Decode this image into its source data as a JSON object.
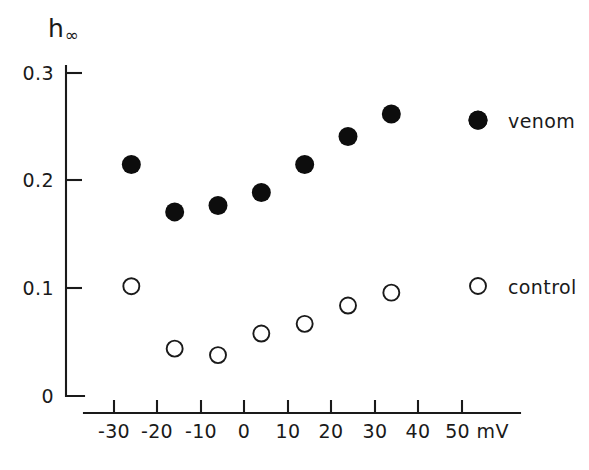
{
  "chart_data": {
    "type": "scatter",
    "title": "",
    "xlabel": "mV",
    "ylabel": "h∞",
    "ylabel_base": "h",
    "ylabel_sub": "∞",
    "xlim": [
      -35,
      57
    ],
    "ylim": [
      0,
      0.315
    ],
    "grid": false,
    "legend_position": "right",
    "xticks": [
      -30,
      -20,
      -10,
      0,
      10,
      20,
      30,
      40,
      50
    ],
    "xtick_labels": [
      "-30",
      "-20",
      "-10",
      "0",
      "10",
      "20",
      "30",
      "40",
      "50 mV"
    ],
    "yticks": [
      0,
      0.1,
      0.2,
      0.3
    ],
    "ytick_labels": [
      "0",
      "0.1",
      "0.2",
      "0.3"
    ],
    "series": [
      {
        "name": "venom",
        "marker": "filled-circle",
        "color": "#0d0d0d",
        "x": [
          -26,
          -16,
          -6,
          4,
          14,
          24,
          34,
          54
        ],
        "values": [
          0.215,
          0.171,
          0.177,
          0.189,
          0.215,
          0.241,
          0.262,
          0.256
        ]
      },
      {
        "name": "control",
        "marker": "open-circle",
        "color": "#1a1a1a",
        "x": [
          -26,
          -16,
          -6,
          4,
          14,
          24,
          34
        ],
        "values": [
          0.102,
          0.044,
          0.038,
          0.058,
          0.067,
          0.084,
          0.096
        ]
      }
    ]
  },
  "legend": {
    "entries": [
      {
        "label": "venom",
        "marker": "filled-circle"
      },
      {
        "label": "control",
        "marker": "open-circle"
      }
    ]
  },
  "colors": {
    "background": "#ffffff",
    "ink": "#1a1a1a",
    "marker_fill": "#0d0d0d"
  }
}
